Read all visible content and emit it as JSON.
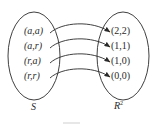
{
  "diagram": {
    "type": "mapping",
    "domain_set": {
      "label": "S",
      "elements": [
        "(a,a)",
        "(a,r)",
        "(r,a)",
        "(r,r)"
      ]
    },
    "codomain_set": {
      "label": "R",
      "label_superscript": "2",
      "elements": [
        "(2,2)",
        "(1,1)",
        "(1,0)",
        "(0,0)"
      ]
    },
    "mappings": [
      {
        "from": "(a,a)",
        "to": "(2,2)"
      },
      {
        "from": "(a,r)",
        "to": "(1,1)"
      },
      {
        "from": "(r,a)",
        "to": "(1,0)"
      },
      {
        "from": "(r,r)",
        "to": "(0,0)"
      }
    ],
    "colors": {
      "stroke": "#2a2a2a",
      "background": "#ffffff"
    }
  }
}
